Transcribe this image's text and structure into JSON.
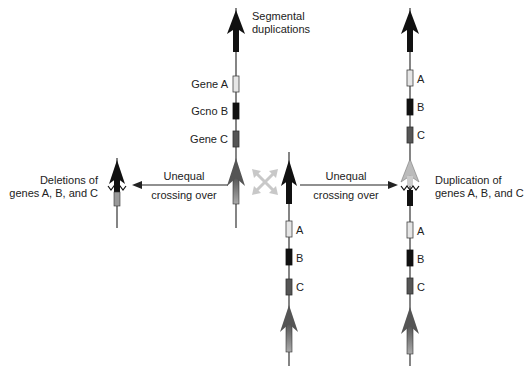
{
  "diagram": {
    "title_label": "Segmental duplications",
    "colors": {
      "gene_a": "#e6e6e6",
      "gene_b": "#111111",
      "gene_c": "#555555",
      "segment_black": "#111111",
      "segment_gray": "#6e6e6e",
      "segment_light": "#bbbbbb",
      "cross_arrows": "#c8c8c8",
      "line": "#333333"
    },
    "top_chromosome": {
      "genes": [
        "Gene A",
        "Gcno B",
        "Gene C"
      ]
    },
    "bottom_chromosome": {
      "genes": [
        "A",
        "B",
        "C"
      ]
    },
    "right_chromosome": {
      "genes_top": [
        "A",
        "B",
        "C"
      ],
      "genes_bottom": [
        "A",
        "B",
        "C"
      ]
    },
    "left_arrow": {
      "line1": "Unequal",
      "line2": "crossing over"
    },
    "right_arrow": {
      "line1": "Unequal",
      "line2": "crossing over"
    },
    "left_result": {
      "line1": "Deletions of",
      "line2": "genes A, B, and C"
    },
    "right_result": {
      "line1": "Duplication of",
      "line2": "genes A, B, and C"
    }
  }
}
